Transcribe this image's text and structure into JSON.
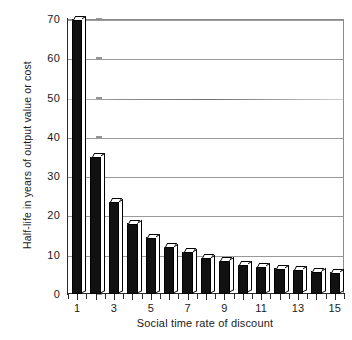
{
  "chart_data": {
    "type": "bar",
    "title": "",
    "xlabel": "Social time rate of discount",
    "ylabel": "Half-life in years of output value or cost",
    "categories": [
      "1",
      "2",
      "3",
      "4",
      "5",
      "6",
      "7",
      "8",
      "9",
      "10",
      "11",
      "12",
      "13",
      "14",
      "15"
    ],
    "values": [
      70,
      35,
      23.5,
      18,
      14.5,
      12,
      10.7,
      9.2,
      8.5,
      7.5,
      7,
      6.5,
      6.2,
      5.8,
      5.5
    ],
    "xlim": [
      0.5,
      15.5
    ],
    "ylim": [
      0,
      70
    ],
    "ytick_labels": [
      "0",
      "10",
      "20",
      "30",
      "40",
      "50",
      "60",
      "70"
    ],
    "ytick_values": [
      0,
      10,
      20,
      30,
      40,
      50,
      60,
      70
    ],
    "xtick_labels": [
      "1",
      "3",
      "5",
      "7",
      "9",
      "11",
      "13",
      "15"
    ],
    "xtick_values": [
      1,
      3,
      5,
      7,
      9,
      11,
      13,
      15
    ],
    "grid": "horizontal",
    "legend": "none",
    "bar_face_color": "#111111",
    "bar_top_color": "#ffffff",
    "grid_color": "#9a9a9a",
    "axis_color": "#2b2b2b"
  }
}
